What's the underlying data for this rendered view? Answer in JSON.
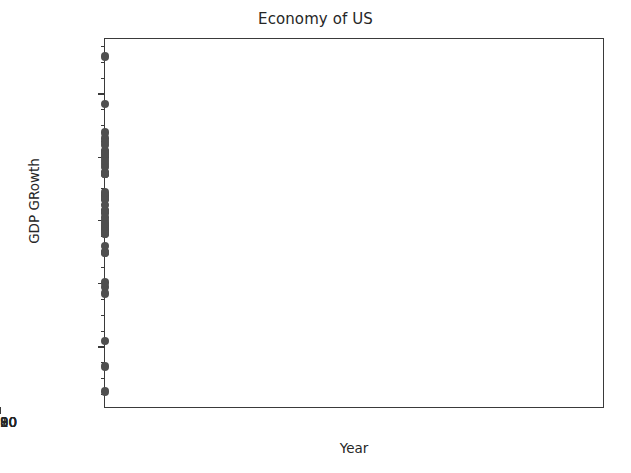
{
  "chart_data": {
    "type": "scatter",
    "title": "Economy of US",
    "xlabel": "Year",
    "ylabel": "GDP GRowth",
    "xlim": [
      1978.6,
      1978.6
    ],
    "ylim": [
      -0.0395,
      0.0775
    ],
    "grid": false,
    "legend": null,
    "marker_color": "#4f4f4f",
    "axis_color": "#3a3a3a",
    "background_color": "#ffffff",
    "x_ticks": [
      1980,
      1990,
      2000,
      2010,
      2020
    ],
    "x_tick_labels": [
      "1980",
      "1990",
      "2000",
      "2010",
      "2020"
    ],
    "y_ticks": [
      -0.02,
      0.0,
      0.02,
      0.04,
      0.06
    ],
    "y_tick_labels": [
      "−0.02",
      "0.00",
      "0.02",
      "0.04",
      "0.06"
    ],
    "x_min": 1978.6,
    "x_max": 1978.6,
    "y_min": -0.0395,
    "y_max": 0.0775,
    "x": [
      1980,
      1981,
      1982,
      1983,
      1984,
      1985,
      1986,
      1987,
      1988,
      1989,
      1990,
      1991,
      1992,
      1993,
      1994,
      1995,
      1996,
      1997,
      1998,
      1999,
      2000,
      2001,
      2002,
      2003,
      2004,
      2005,
      2006,
      2007,
      2008,
      2009,
      2010,
      2011,
      2012,
      2013,
      2014,
      2015,
      2016,
      2017,
      2018,
      2019,
      2020,
      2021,
      2022,
      2023,
      2024,
      2025,
      2026,
      2027
    ],
    "y": [
      -0.003,
      0.025,
      -0.018,
      0.046,
      0.072,
      0.042,
      0.035,
      0.035,
      0.042,
      0.037,
      0.019,
      -0.001,
      0.035,
      0.028,
      0.04,
      0.027,
      0.038,
      0.044,
      0.045,
      0.048,
      0.041,
      0.01,
      0.017,
      0.028,
      0.039,
      0.035,
      0.028,
      0.02,
      0.0005,
      -0.026,
      0.027,
      0.016,
      0.023,
      0.018,
      0.023,
      0.027,
      0.017,
      0.023,
      0.029,
      0.023,
      -0.034,
      0.057,
      0.016,
      0.01,
      0.012,
      0.018,
      0.021,
      0.019
    ],
    "points": [
      {
        "x": 1980,
        "y": -0.003
      },
      {
        "x": 1981,
        "y": 0.025
      },
      {
        "x": 1982,
        "y": -0.018
      },
      {
        "x": 1983,
        "y": 0.046
      },
      {
        "x": 1984,
        "y": 0.072
      },
      {
        "x": 1985,
        "y": 0.042
      },
      {
        "x": 1986,
        "y": 0.035
      },
      {
        "x": 1987,
        "y": 0.035
      },
      {
        "x": 1988,
        "y": 0.042
      },
      {
        "x": 1989,
        "y": 0.037
      },
      {
        "x": 1990,
        "y": 0.019
      },
      {
        "x": 1991,
        "y": -0.001
      },
      {
        "x": 1992,
        "y": 0.035
      },
      {
        "x": 1993,
        "y": 0.028
      },
      {
        "x": 1994,
        "y": 0.04
      },
      {
        "x": 1995,
        "y": 0.027
      },
      {
        "x": 1996,
        "y": 0.038
      },
      {
        "x": 1997,
        "y": 0.044
      },
      {
        "x": 1998,
        "y": 0.045
      },
      {
        "x": 1999,
        "y": 0.048
      },
      {
        "x": 2000,
        "y": 0.041
      },
      {
        "x": 2001,
        "y": 0.01
      },
      {
        "x": 2002,
        "y": 0.017
      },
      {
        "x": 2003,
        "y": 0.028
      },
      {
        "x": 2004,
        "y": 0.039
      },
      {
        "x": 2005,
        "y": 0.035
      },
      {
        "x": 2006,
        "y": 0.028
      },
      {
        "x": 2007,
        "y": 0.02
      },
      {
        "x": 2008,
        "y": 0.0005
      },
      {
        "x": 2009,
        "y": -0.026
      },
      {
        "x": 2010,
        "y": 0.027
      },
      {
        "x": 2011,
        "y": 0.016
      },
      {
        "x": 2012,
        "y": 0.023
      },
      {
        "x": 2013,
        "y": 0.018
      },
      {
        "x": 2014,
        "y": 0.023
      },
      {
        "x": 2015,
        "y": 0.027
      },
      {
        "x": 2016,
        "y": 0.017
      },
      {
        "x": 2017,
        "y": 0.023
      },
      {
        "x": 2018,
        "y": 0.029
      },
      {
        "x": 2019,
        "y": 0.023
      },
      {
        "x": 2020,
        "y": -0.034
      },
      {
        "x": 2021,
        "y": 0.057
      },
      {
        "x": 2022,
        "y": 0.016
      },
      {
        "x": 2023,
        "y": 0.01
      },
      {
        "x": 2024,
        "y": 0.012
      },
      {
        "x": 2025,
        "y": 0.018
      },
      {
        "x": 2026,
        "y": 0.021
      },
      {
        "x": 2027,
        "y": 0.019
      }
    ]
  },
  "figure": {
    "title": "Economy of US",
    "xlabel": "Year",
    "ylabel": "GDP GRowth"
  }
}
